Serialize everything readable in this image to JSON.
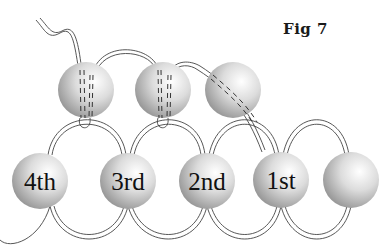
{
  "figure": {
    "title": "Fig 7",
    "bottom_beads": [
      {
        "label": "4th",
        "cx": 40,
        "cy": 181
      },
      {
        "label": "3rd",
        "cx": 128,
        "cy": 181
      },
      {
        "label": "2nd",
        "cx": 207,
        "cy": 181
      },
      {
        "label": "1st",
        "cx": 281,
        "cy": 180
      },
      {
        "label": "",
        "cx": 351,
        "cy": 180
      }
    ],
    "top_beads": [
      {
        "cx": 86,
        "cy": 90
      },
      {
        "cx": 163,
        "cy": 90
      },
      {
        "cx": 233,
        "cy": 90
      }
    ],
    "colors": {
      "bead_light": "#ffffff",
      "bead_dark": "#8f8f8f",
      "thread": "#444444",
      "label": "#111111"
    }
  }
}
